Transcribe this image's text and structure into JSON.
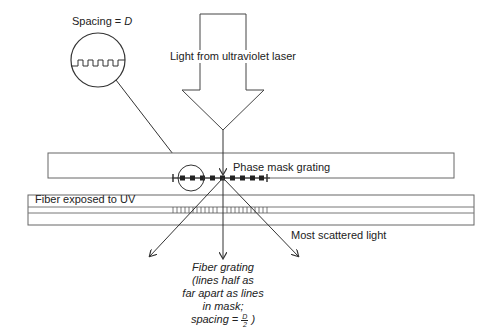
{
  "diagram": {
    "labels": {
      "spacing": "Spacing = ",
      "spacing_var": "D",
      "laser": "Light from ultraviolet laser",
      "phase_mask": "Phase mask grating",
      "fiber": "Fiber exposed to UV",
      "scattered": "Most scattered light",
      "fiber_grating_line1": "Fiber grating",
      "fiber_grating_line2": "(lines half as",
      "fiber_grating_line3": "far apart as lines",
      "fiber_grating_line4": "in mask;",
      "fiber_grating_line5_prefix": "spacing = ",
      "fraction_num": "D",
      "fraction_den": "2",
      "fiber_grating_line5_suffix": ")"
    },
    "colors": {
      "stroke": "#555555",
      "text": "#222222",
      "background": "#ffffff"
    }
  }
}
